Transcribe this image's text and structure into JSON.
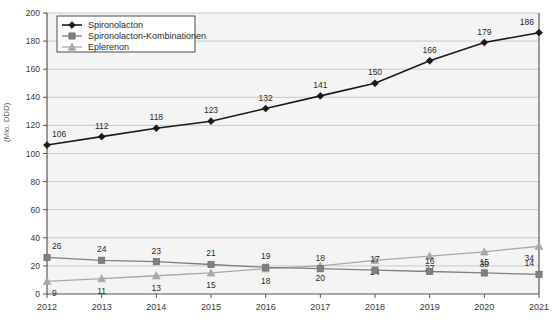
{
  "chart_data": {
    "type": "line",
    "title": "",
    "xlabel": "",
    "ylabel": "(Mio. DDD)",
    "categories": [
      "2012",
      "2013",
      "2014",
      "2015",
      "2016",
      "2017",
      "2018",
      "2019",
      "2020",
      "2021"
    ],
    "ylim": [
      0,
      200
    ],
    "ytick_step": 20,
    "yticks": [
      "0",
      "20",
      "40",
      "60",
      "80",
      "100",
      "120",
      "140",
      "160",
      "180",
      "200"
    ],
    "grid": true,
    "legend_position": "top-left",
    "series": [
      {
        "name": "Spironolacton",
        "marker": "diamond",
        "color": "#1a1a1a",
        "values": [
          106,
          112,
          118,
          123,
          132,
          141,
          150,
          166,
          179,
          186
        ]
      },
      {
        "name": "Spironolacton-Kombinationen",
        "marker": "square",
        "color": "#808080",
        "values": [
          26,
          24,
          23,
          21,
          19,
          18,
          17,
          16,
          15,
          14
        ]
      },
      {
        "name": "Eplerenon",
        "marker": "triangle",
        "color": "#a8a8a8",
        "values": [
          9,
          11,
          13,
          15,
          18,
          20,
          24,
          27,
          30,
          34
        ]
      }
    ]
  },
  "style": {
    "plot_background": "#f4f4f4",
    "grid_color": "#c9c9c9",
    "axis_color": "#555555",
    "tick_text_color": "#3a3a3a",
    "legend_background": "#ffffff",
    "legend_border": "#4a4a4a"
  }
}
